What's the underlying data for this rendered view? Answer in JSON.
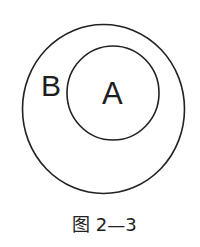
{
  "figure": {
    "type": "venn-subset",
    "caption": "图 2—3",
    "line_color": "#222222",
    "background": "#ffffff",
    "sets": [
      {
        "id": "outer",
        "label": "B",
        "shape": "ellipse",
        "cx": 103.5,
        "cy": 109,
        "rx": 81,
        "ry": 84.5
      },
      {
        "id": "inner",
        "label": "A",
        "shape": "ellipse",
        "cx": 113,
        "cy": 93,
        "rx": 46,
        "ry": 47
      }
    ],
    "relation": "A ⊂ B"
  }
}
